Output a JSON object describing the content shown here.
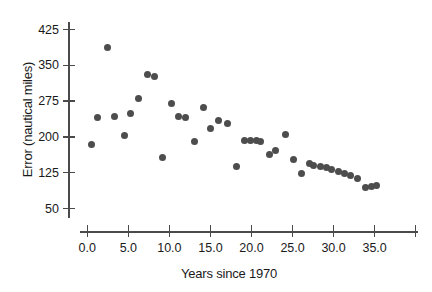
{
  "chart_data": {
    "type": "scatter",
    "title": "",
    "xlabel": "Years since 1970",
    "ylabel": "Error (nautical miles)",
    "xlim": [
      -1.5,
      40.2
    ],
    "ylim": [
      33,
      440
    ],
    "grid": false,
    "legend": null,
    "marker_color": "#4d4d4d",
    "axis_color": "#4a4a4a",
    "xticks": [
      0.0,
      5.0,
      10.0,
      15.0,
      20.0,
      25.0,
      30.0,
      35.0,
      40.0
    ],
    "xtick_labels": [
      "0.0",
      "5.0",
      "10.0",
      "15.0",
      "20.0",
      "25.0",
      "30.0",
      "35.0",
      ""
    ],
    "yticks": [
      425,
      350,
      275,
      200,
      125,
      50
    ],
    "ytick_labels": [
      "425",
      "350",
      "275",
      "200",
      "125",
      "50"
    ],
    "points": [
      {
        "x": 0.5,
        "y": 185
      },
      {
        "x": 1.3,
        "y": 240
      },
      {
        "x": 2.4,
        "y": 388
      },
      {
        "x": 3.3,
        "y": 243
      },
      {
        "x": 4.5,
        "y": 202
      },
      {
        "x": 5.3,
        "y": 250
      },
      {
        "x": 6.2,
        "y": 281
      },
      {
        "x": 7.3,
        "y": 331
      },
      {
        "x": 8.2,
        "y": 327
      },
      {
        "x": 9.2,
        "y": 157
      },
      {
        "x": 10.2,
        "y": 271
      },
      {
        "x": 11.1,
        "y": 243
      },
      {
        "x": 12.0,
        "y": 240
      },
      {
        "x": 13.1,
        "y": 190
      },
      {
        "x": 14.2,
        "y": 261
      },
      {
        "x": 15.0,
        "y": 218
      },
      {
        "x": 16.0,
        "y": 234
      },
      {
        "x": 17.1,
        "y": 228
      },
      {
        "x": 18.2,
        "y": 138
      },
      {
        "x": 19.2,
        "y": 192
      },
      {
        "x": 19.9,
        "y": 192
      },
      {
        "x": 20.6,
        "y": 192
      },
      {
        "x": 21.1,
        "y": 190
      },
      {
        "x": 22.2,
        "y": 164
      },
      {
        "x": 22.9,
        "y": 171
      },
      {
        "x": 24.2,
        "y": 205
      },
      {
        "x": 25.1,
        "y": 152
      },
      {
        "x": 26.1,
        "y": 123
      },
      {
        "x": 27.1,
        "y": 145
      },
      {
        "x": 27.5,
        "y": 141
      },
      {
        "x": 28.4,
        "y": 138
      },
      {
        "x": 29.1,
        "y": 135
      },
      {
        "x": 29.8,
        "y": 131
      },
      {
        "x": 30.6,
        "y": 127
      },
      {
        "x": 31.3,
        "y": 123
      },
      {
        "x": 32.1,
        "y": 119
      },
      {
        "x": 32.9,
        "y": 112
      },
      {
        "x": 33.9,
        "y": 95
      },
      {
        "x": 34.6,
        "y": 96
      },
      {
        "x": 35.2,
        "y": 98
      }
    ]
  }
}
